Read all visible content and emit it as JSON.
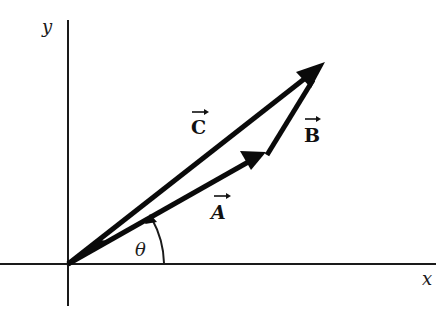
{
  "axes": {
    "x_label": "x",
    "y_label": "y"
  },
  "vectors": [
    {
      "id": "A",
      "label": "A",
      "from": [
        68,
        264
      ],
      "to": [
        265,
        152
      ]
    },
    {
      "id": "B",
      "label": "B",
      "from": [
        268,
        154
      ],
      "to": [
        323,
        64
      ]
    },
    {
      "id": "C",
      "label": "C",
      "from": [
        68,
        264
      ],
      "to": [
        323,
        64
      ]
    }
  ],
  "angle": {
    "label": "θ",
    "between": [
      "x-axis",
      "A"
    ]
  },
  "relation": "C = A + B",
  "colors": {
    "ink": "#0a0a0a",
    "background": "#ffffff"
  }
}
